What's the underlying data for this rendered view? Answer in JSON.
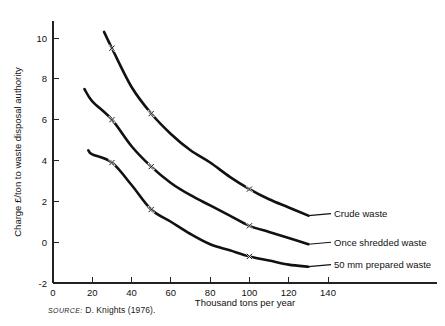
{
  "figure": {
    "source_prefix": "SOURCE:",
    "source_text": "D. Knights (1976)."
  },
  "chart_data": {
    "type": "line",
    "title": "",
    "xlabel": "Thousand tons per year",
    "ylabel": "Charge £/ton to waste disposal authority",
    "xlim": [
      0,
      150
    ],
    "ylim": [
      -2,
      11
    ],
    "xticks": [
      0,
      20,
      40,
      60,
      80,
      100,
      120,
      140
    ],
    "xtick_labels": [
      "0",
      "20",
      "40",
      "60",
      "80",
      "100",
      "120",
      "140"
    ],
    "yticks": [
      -2,
      0,
      2,
      4,
      6,
      8,
      10
    ],
    "ytick_labels": [
      "-2",
      "0",
      "2",
      "4",
      "6",
      "8",
      "10"
    ],
    "grid": false,
    "legend_position": "right-inline",
    "series": [
      {
        "name": "Crude waste",
        "label": "Crude waste",
        "x": [
          26,
          30,
          40,
          50,
          60,
          70,
          80,
          90,
          100,
          110,
          120,
          130
        ],
        "y": [
          10.3,
          9.5,
          7.6,
          6.3,
          5.3,
          4.5,
          3.9,
          3.2,
          2.6,
          2.1,
          1.7,
          1.3
        ],
        "markers": [
          {
            "x": 30,
            "y": 9.5
          },
          {
            "x": 50,
            "y": 6.3
          },
          {
            "x": 100,
            "y": 2.6
          }
        ],
        "label_anchor": {
          "x": 130,
          "y": 1.3
        }
      },
      {
        "name": "Once shredded waste",
        "label": "Once shredded waste",
        "x": [
          16,
          20,
          30,
          40,
          50,
          60,
          70,
          80,
          90,
          100,
          110,
          120,
          130
        ],
        "y": [
          7.5,
          6.9,
          6.0,
          4.7,
          3.7,
          2.9,
          2.3,
          1.8,
          1.3,
          0.8,
          0.5,
          0.2,
          -0.1
        ],
        "markers": [
          {
            "x": 30,
            "y": 6.0
          },
          {
            "x": 50,
            "y": 3.7
          },
          {
            "x": 100,
            "y": 0.8
          }
        ],
        "label_anchor": {
          "x": 130,
          "y": -0.1
        }
      },
      {
        "name": "50 mm prepared waste",
        "label": "50 mm prepared waste",
        "x": [
          18,
          20,
          30,
          40,
          50,
          60,
          70,
          80,
          90,
          100,
          110,
          120,
          130
        ],
        "y": [
          4.5,
          4.3,
          3.9,
          2.8,
          1.6,
          1.0,
          0.4,
          -0.1,
          -0.4,
          -0.7,
          -0.9,
          -1.1,
          -1.2
        ],
        "markers": [
          {
            "x": 30,
            "y": 3.9
          },
          {
            "x": 50,
            "y": 1.6
          },
          {
            "x": 100,
            "y": -0.7
          }
        ],
        "label_anchor": {
          "x": 130,
          "y": -1.2
        }
      }
    ],
    "marker_symbol": "x",
    "line_color": "#111111"
  }
}
